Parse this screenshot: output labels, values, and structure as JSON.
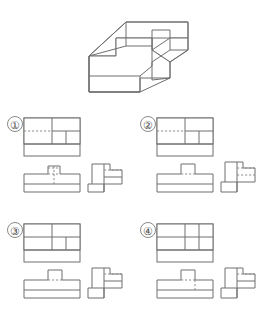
{
  "page": {
    "background_color": "#ffffff",
    "line_color": "#6e6e6e",
    "hidden_line_color": "#8d8d8d",
    "label_color": "#4a4a4a",
    "width": 267,
    "height": 321
  },
  "isometric": {
    "name": "isometric-solid",
    "description": "Stepped block solid shown in isometric projection",
    "outline_points": "110,70 150,22 190,22 190,42 205,42 205,30 225,30 225,52 205,52 205,70 190,70 190,90 150,90 150,70",
    "caption": ""
  },
  "options": [
    {
      "id": "1",
      "label": "①",
      "name": "option-1",
      "views": [
        {
          "name": "top-view",
          "hidden_line": "dashed",
          "hidden_line_position": "upper-left-horizontal"
        },
        {
          "name": "front-view",
          "hidden_line": "dashed",
          "hidden_line_position": "notch-vertical-and-horizontal"
        },
        {
          "name": "side-view",
          "hidden_line": "dashed",
          "hidden_line_position": "upper-horizontal"
        }
      ]
    },
    {
      "id": "2",
      "label": "②",
      "name": "option-2",
      "views": [
        {
          "name": "top-view",
          "hidden_line": "dashed",
          "hidden_line_position": "upper-left-horizontal"
        },
        {
          "name": "front-view",
          "hidden_line": "dashed",
          "hidden_line_position": "short-horizontal"
        },
        {
          "name": "side-view",
          "hidden_line": "dashed",
          "hidden_line_position": "two-horizontals"
        }
      ]
    },
    {
      "id": "3",
      "label": "③",
      "name": "option-3",
      "views": [
        {
          "name": "top-view",
          "hidden_line": "solid",
          "hidden_line_position": "none"
        },
        {
          "name": "front-view",
          "hidden_line": "dashed",
          "hidden_line_position": "short-horizontal"
        },
        {
          "name": "side-view",
          "hidden_line": "dashed",
          "hidden_line_position": "upper-horizontal"
        }
      ]
    },
    {
      "id": "4",
      "label": "④",
      "name": "option-4",
      "views": [
        {
          "name": "top-view",
          "hidden_line": "solid",
          "hidden_line_position": "none"
        },
        {
          "name": "front-view",
          "hidden_line": "dashed",
          "hidden_line_position": "notch-horizontal-and-vertical"
        },
        {
          "name": "side-view",
          "hidden_line": "dashed",
          "hidden_line_position": "upper-horizontal"
        }
      ]
    }
  ]
}
